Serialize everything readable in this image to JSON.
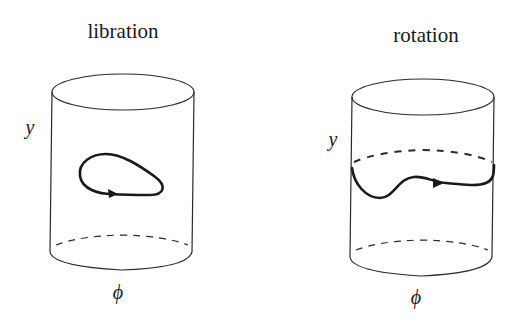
{
  "panels": [
    {
      "id": "libration",
      "title": "libration",
      "vertical_axis_label": "y",
      "horizontal_axis_label": "ϕ",
      "trajectory": "closed loop on cylinder surface (does not wrap around)"
    },
    {
      "id": "rotation",
      "title": "rotation",
      "vertical_axis_label": "y",
      "horizontal_axis_label": "ϕ",
      "trajectory": "open curve wrapping around the cylinder"
    }
  ],
  "colors": {
    "line": "#2a2a2a",
    "trajectory": "#1a1a1a",
    "background": "#ffffff"
  }
}
